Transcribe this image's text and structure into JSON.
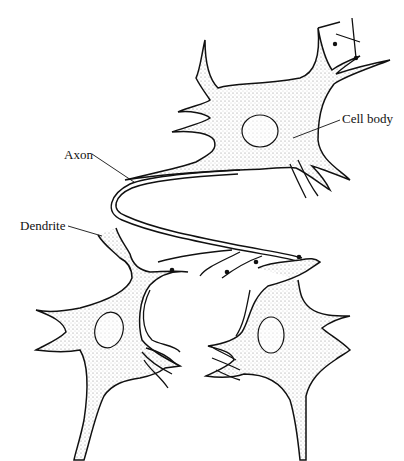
{
  "diagram": {
    "labels": {
      "cell_body": "Cell body",
      "axon": "Axon",
      "dendrite": "Dendrite"
    },
    "colors": {
      "outline": "#111111",
      "stipple": "#9a9a9a",
      "background": "#ffffff"
    }
  }
}
